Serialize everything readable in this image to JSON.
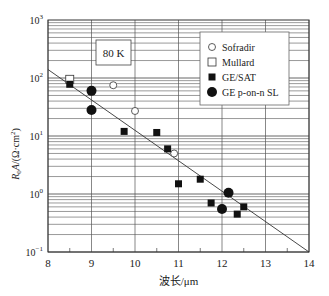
{
  "chart_data": {
    "type": "scatter",
    "title": "",
    "annotation": "80 K",
    "xlabel": "波长/μm",
    "ylabel": "R0A/(Ω·cm²)",
    "xlim": [
      8,
      14
    ],
    "ylim": [
      0.1,
      1000
    ],
    "yscale": "log",
    "x_ticks": [
      "8",
      "9",
      "10",
      "11",
      "12",
      "13",
      "14"
    ],
    "y_ticks": [
      "10^-1",
      "10^0",
      "10^1",
      "10^2",
      "10^3"
    ],
    "grid": true,
    "legend_position": "upper right",
    "series": [
      {
        "name": "Sofradir",
        "marker": "open-circle",
        "points": [
          [
            9.5,
            75
          ],
          [
            10,
            27
          ],
          [
            10.9,
            5
          ]
        ]
      },
      {
        "name": "Mullard",
        "marker": "open-square",
        "points": [
          [
            8.5,
            95
          ]
        ]
      },
      {
        "name": "GE/SAT",
        "marker": "filled-square",
        "points": [
          [
            8.5,
            78
          ],
          [
            9.75,
            12
          ],
          [
            10.5,
            11.5
          ],
          [
            10.75,
            6
          ],
          [
            11,
            1.5
          ],
          [
            11.5,
            1.8
          ],
          [
            11.75,
            0.7
          ],
          [
            12.35,
            0.45
          ],
          [
            12.5,
            0.6
          ]
        ]
      },
      {
        "name": "GE p-on-n SL",
        "marker": "filled-circle",
        "points": [
          [
            9,
            60
          ],
          [
            9,
            28
          ],
          [
            12,
            0.55
          ],
          [
            12.15,
            1.05
          ]
        ]
      }
    ],
    "trend_line": {
      "from": [
        8,
        140
      ],
      "to": [
        14,
        0.1
      ]
    }
  },
  "labels": {
    "temp": "80 K",
    "xlabel": "波长/μm",
    "legend": [
      "Sofradir",
      "Mullard",
      "GE/SAT",
      "GE p-on-n SL"
    ]
  }
}
